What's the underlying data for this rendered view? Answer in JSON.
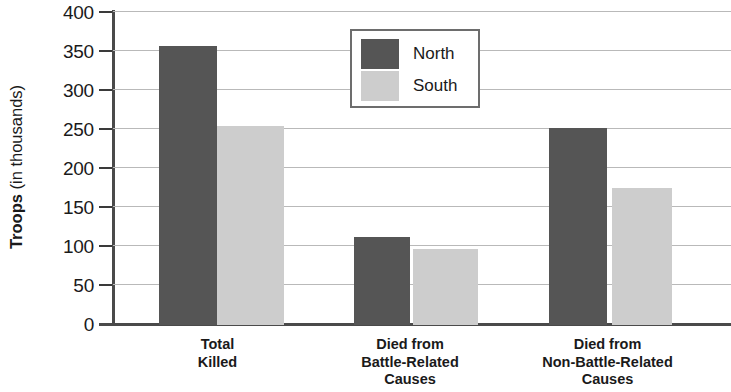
{
  "chart_data": {
    "type": "bar",
    "title": "",
    "xlabel": "",
    "ylabel": "Troops (in thousands)",
    "ylabel_bold_part": "Troops",
    "ylabel_light_part": " (in thousands)",
    "categories": [
      "Total\nKilled",
      "Died from\nBattle-Related\nCauses",
      "Died from\nNon-Battle-Related\nCauses"
    ],
    "series": [
      {
        "name": "North",
        "color": "#555555",
        "values": [
          355,
          112,
          251
        ]
      },
      {
        "name": "South",
        "color": "#cdcdcd",
        "values": [
          254,
          97,
          174
        ]
      }
    ],
    "ylim": [
      0,
      400
    ],
    "ytick_values": [
      400,
      350,
      300,
      250,
      200,
      150,
      100,
      50,
      0
    ],
    "ytick_labels": [
      "400",
      "350",
      "300",
      "250",
      "200",
      "150",
      "100",
      "50",
      "0"
    ],
    "grid": true,
    "legend_position": "top-center",
    "legend_entries": [
      "North",
      "South"
    ]
  },
  "legend": {
    "entries": [
      {
        "label": "North",
        "swatch": "north"
      },
      {
        "label": "South",
        "swatch": "south"
      }
    ]
  },
  "axis": {
    "y_title_bold": "Troops",
    "y_title_light": " (in thousands)",
    "ticks": [
      "400",
      "350",
      "300",
      "250",
      "200",
      "150",
      "100",
      "50",
      "0"
    ]
  },
  "categories": [
    {
      "label": "Total\nKilled"
    },
    {
      "label": "Died from\nBattle-Related\nCauses"
    },
    {
      "label": "Died from\nNon-Battle-Related\nCauses"
    }
  ]
}
